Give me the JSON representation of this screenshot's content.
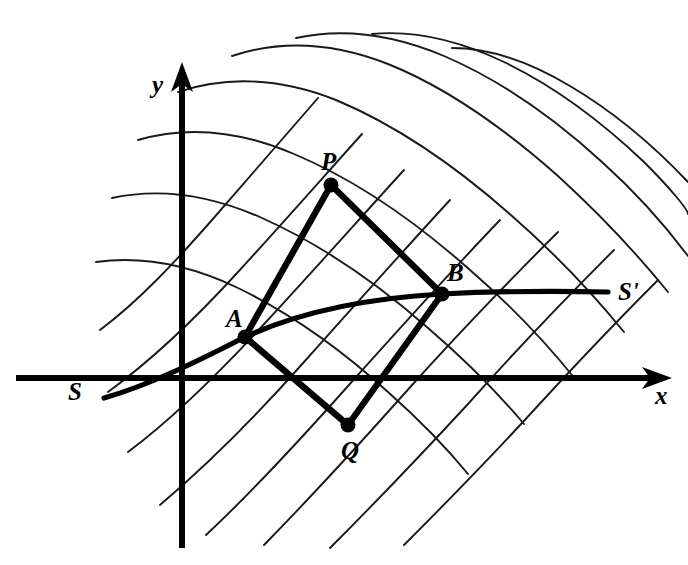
{
  "figure": {
    "background_color": "#ffffff",
    "ink_color": "#000000"
  },
  "axes": {
    "x_axis": {
      "label": "x",
      "label_x": 655,
      "label_y": 404,
      "line": {
        "x1": 16,
        "y1": 378,
        "x2": 655,
        "y2": 378
      },
      "arrow_tip": {
        "x": 672,
        "y": 378
      }
    },
    "y_axis": {
      "label": "y",
      "label_x": 152,
      "label_y": 93,
      "line": {
        "x1": 182,
        "y1": 548,
        "x2": 182,
        "y2": 84
      },
      "arrow_tip": {
        "x": 182,
        "y": 62
      }
    }
  },
  "stream_curve": {
    "start_label": "S",
    "end_label": "S'",
    "start_label_x": 68,
    "start_label_y": 400,
    "end_label_x": 618,
    "end_label_y": 300,
    "path": "M 104,398 C 150,385 200,360 245,337 C 300,312 370,298 442,294 C 500,291 560,291 608,292",
    "passes_through": [
      "A",
      "B"
    ]
  },
  "quadrilateral": {
    "name": "APBQ",
    "vertices": [
      {
        "id": "A",
        "label": "A",
        "x": 245,
        "y": 337,
        "label_x": 226,
        "label_y": 327
      },
      {
        "id": "P",
        "label": "P",
        "x": 331,
        "y": 185,
        "label_x": 321,
        "label_y": 170
      },
      {
        "id": "B",
        "label": "B",
        "x": 442,
        "y": 294,
        "label_x": 447,
        "label_y": 281
      },
      {
        "id": "Q",
        "label": "Q",
        "x": 348,
        "y": 425,
        "label_x": 341,
        "label_y": 459
      }
    ],
    "edges": [
      {
        "from": "A",
        "to": "P"
      },
      {
        "from": "P",
        "to": "B"
      },
      {
        "from": "B",
        "to": "Q"
      },
      {
        "from": "Q",
        "to": "A"
      }
    ],
    "vertex_dot_radius": 7.5
  },
  "grid": {
    "description": "Two families of smoothly curving coordinate lines crossing near-orthogonally; spacing narrows toward the lower-left, lines straighten to 45 degrees toward the upper-right",
    "family_a_label": "lines running lower-left to upper-right",
    "family_b_label": "lines running upper-left to lower-right",
    "family_a_count": 8,
    "family_b_count": 8,
    "stroke_width": 1.9,
    "family_a": [
      "M 100,330 C 140,300 175,262 212,220 C 250,176 288,132 318,98",
      "M 108,392 C 152,360 196,318 238,272 C 283,223 326,174 362,134",
      "M 128,452 C 176,416 222,370 266,322 C 316,268 362,216 404,170",
      "M 160,505 C 208,464 258,414 304,362 C 354,306 404,250 450,200",
      "M 206,535 C 252,492 300,440 348,386 C 400,328 452,270 500,220",
      "M 264,545 C 308,500 356,448 404,394 C 456,336 510,280 558,232",
      "M 330,548 C 372,506 420,456 468,404 C 518,348 570,294 614,250",
      "M 404,545 C 444,505 490,458 534,410 C 578,362 622,316 658,280"
    ],
    "family_b": [
      "M 96,262 C 140,256 188,264 238,288 C 292,314 344,352 388,392 C 424,424 450,452 468,474",
      "M 112,198 C 158,188 208,194 262,218 C 320,244 378,284 428,328 C 470,364 502,398 524,424",
      "M 138,140 C 186,126 238,130 294,154 C 356,180 416,222 470,270 C 516,310 552,350 576,380",
      "M 178,92 C 226,76 280,78 336,100 C 398,126 458,168 512,216 C 560,258 598,300 624,332",
      "M 232,56 C 280,40 332,42 388,64 C 448,88 506,130 558,176 C 604,218 642,260 668,292",
      "M 296,38 C 342,28 392,34 444,56 C 500,80 554,118 602,162 C 642,198 670,232 688,256",
      "M 372,34 C 414,30 458,40 504,62 C 554,86 602,122 644,162 C 672,190 688,210 688,214",
      "M 452,48 C 490,48 530,62 570,86 C 614,112 654,146 688,182"
    ]
  }
}
